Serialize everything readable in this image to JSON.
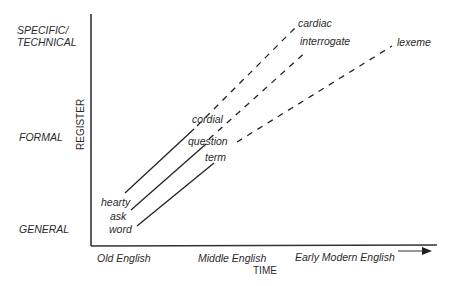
{
  "diagram": {
    "y_axis": {
      "title": "REGISTER",
      "levels": [
        "SPECIFIC/\nTECHNICAL",
        "FORMAL",
        "GENERAL"
      ],
      "level_top": "SPECIFIC/",
      "level_top2": "TECHNICAL",
      "level_mid": "FORMAL",
      "level_low": "GENERAL"
    },
    "x_axis": {
      "title": "TIME",
      "periods": [
        "Old English",
        "Middle English",
        "Early Modern English"
      ],
      "p0": "Old English",
      "p1": "Middle English",
      "p2": "Early Modern English"
    },
    "words": {
      "hearty": "hearty",
      "ask": "ask",
      "word": "word",
      "cordial": "cordial",
      "question": "question",
      "term": "term",
      "cardiac": "cardiac",
      "interrogate": "interrogate",
      "lexeme": "lexeme"
    },
    "chains": [
      [
        "hearty",
        "cordial",
        "cardiac"
      ],
      [
        "ask",
        "question",
        "interrogate"
      ],
      [
        "word",
        "term",
        "lexeme"
      ]
    ],
    "line_color": "#222222"
  }
}
